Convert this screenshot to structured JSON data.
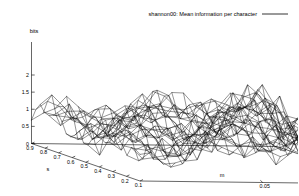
{
  "chart_data": {
    "type": "line",
    "render": "3d-wireframe-surface",
    "title": "",
    "legend": {
      "position": "top-right",
      "entries": [
        {
          "label": "shannon00: Mean information per character",
          "sample": "line"
        }
      ]
    },
    "zlabel": "bits",
    "xlabel": "s",
    "ylabel": "m",
    "grid": false,
    "zlim": [
      0,
      2
    ],
    "zticks": [
      "2",
      "1.5",
      "1",
      "0.5",
      "0"
    ],
    "ztick_values": [
      2,
      1.5,
      1,
      0.5,
      0
    ],
    "xlim": [
      0.1,
      0.9
    ],
    "xticks": [
      "0.9",
      "0.8",
      "0.7",
      "0.6",
      "0.5",
      "0.4",
      "0.3",
      "0.2",
      "0.1"
    ],
    "xtick_values": [
      0.9,
      0.8,
      0.7,
      0.6,
      0.5,
      0.4,
      0.3,
      0.2,
      0.1
    ],
    "ylim": [
      0,
      0.1
    ],
    "yticks": [
      "0.05",
      "0"
    ],
    "ytick_values": [
      0.05,
      0
    ],
    "mesh": {
      "nx": 26,
      "ny": 22,
      "base_level": 1.0,
      "ridge_amplitude": 0.42,
      "ridge_periods_x": 5.5,
      "ridge_periods_y": 4.5,
      "slope_x": 0.3,
      "slope_y": 0.55,
      "edge_dropoff": 0.75,
      "noise_amplitude": 0.12
    },
    "colors": {
      "surface": "#000000",
      "axes": "#000000",
      "background": "#ffffff",
      "text": "#000000"
    }
  }
}
